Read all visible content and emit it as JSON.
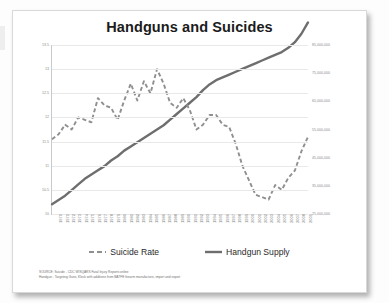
{
  "chart_data": {
    "type": "line",
    "title": "Handguns and Suicides",
    "xlabel": "",
    "ylabel": "",
    "grid": true,
    "legend_position": "bottom",
    "x": [
      1970,
      1971,
      1972,
      1973,
      1974,
      1975,
      1976,
      1977,
      1978,
      1979,
      1980,
      1981,
      1982,
      1983,
      1984,
      1985,
      1986,
      1987,
      1988,
      1989,
      1990,
      1991,
      1992,
      1993,
      1994,
      1995,
      1996,
      1997,
      1998,
      1999,
      2000,
      2001,
      2002,
      2003,
      2004,
      2005,
      2006,
      2007,
      2008,
      2009
    ],
    "xtick_labels": [
      "1970",
      "1971",
      "1972",
      "1973",
      "1974",
      "1975",
      "1976",
      "1977",
      "1978",
      "1979",
      "1980",
      "1981",
      "1982",
      "1983",
      "1984",
      "1985",
      "1986",
      "1987",
      "1988",
      "1989",
      "1990",
      "1991",
      "1992",
      "1993",
      "1994",
      "1995",
      "1996",
      "1997",
      "1998",
      "1999",
      "2000",
      "2001",
      "2002",
      "2003",
      "2004",
      "2005",
      "2006",
      "2007",
      "2008",
      "2009"
    ],
    "left_axis": {
      "name": "Suicide Rate",
      "ylim": [
        10.0,
        13.5
      ],
      "ticks": [
        13.5,
        13.0,
        12.5,
        12.0,
        11.5,
        11.0,
        10.5,
        10.0
      ],
      "tick_labels": [
        "13.5",
        "13",
        "12.5",
        "12",
        "11.5",
        "11",
        "10.5",
        "10"
      ]
    },
    "right_axis": {
      "name": "Handgun Supply",
      "ylim": [
        25000000,
        85000000
      ],
      "ticks": [
        85000000,
        75000000,
        65000000,
        55000000,
        45000000,
        35000000,
        25000000
      ],
      "tick_labels": [
        "85,000,000",
        "75,000,000",
        "65,000,000",
        "55,000,000",
        "45,000,000",
        "35,000,000",
        "25,000,000"
      ]
    },
    "series": [
      {
        "name": "Suicide Rate",
        "axis": "left",
        "style": "dashed",
        "color": "#8f8f8f",
        "values": [
          11.55,
          11.65,
          11.85,
          11.75,
          12.0,
          11.95,
          11.9,
          12.4,
          12.25,
          12.2,
          11.95,
          12.35,
          12.7,
          12.35,
          12.75,
          12.5,
          13.0,
          12.7,
          12.3,
          12.2,
          12.4,
          12.15,
          11.75,
          11.85,
          12.05,
          12.05,
          11.85,
          11.8,
          11.45,
          11.0,
          10.7,
          10.4,
          10.35,
          10.3,
          10.6,
          10.5,
          10.75,
          10.9,
          11.3,
          11.6
        ]
      },
      {
        "name": "Handgun Supply",
        "axis": "right",
        "style": "solid",
        "color": "#6e6e6e",
        "values": [
          28500000,
          30000000,
          31500000,
          33500000,
          35500000,
          37500000,
          39000000,
          40500000,
          42000000,
          44000000,
          45500000,
          47500000,
          49000000,
          50500000,
          52000000,
          53500000,
          55000000,
          56500000,
          58500000,
          60500000,
          62500000,
          64500000,
          66500000,
          69000000,
          71000000,
          72500000,
          73500000,
          74500000,
          75500000,
          76500000,
          77500000,
          78500000,
          79500000,
          80500000,
          81500000,
          82500000,
          84000000,
          86000000,
          89000000,
          93000000
        ]
      }
    ]
  },
  "legend": {
    "items": [
      {
        "label": "Suicide Rate",
        "style": "dashed"
      },
      {
        "label": "Handgun Supply",
        "style": "solid"
      }
    ]
  },
  "source": {
    "line1": "SOURCE: Suicide - CDC WISQARS Fatal Injury Reports online",
    "line2": "Handgun - Targeting Guns, Kleck with additions from BATFE firearm manufacture, import and export"
  }
}
